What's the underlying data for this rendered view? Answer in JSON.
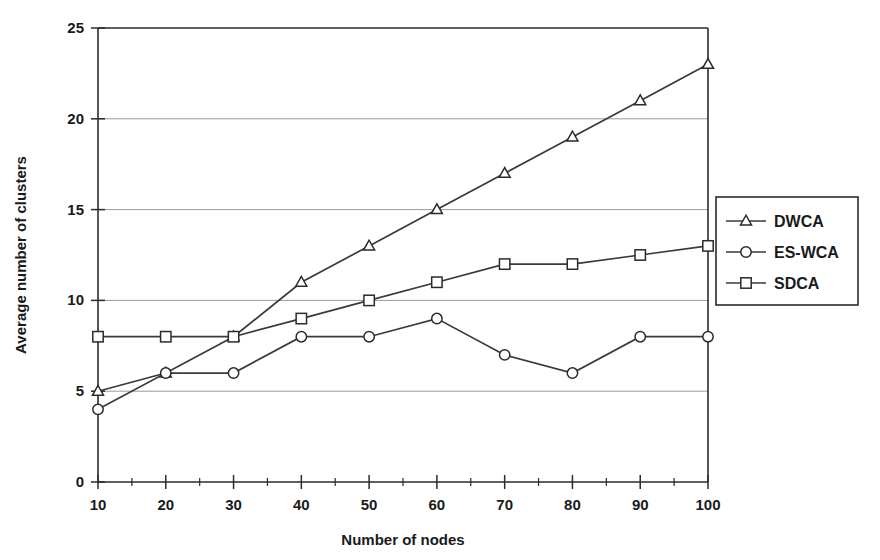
{
  "chart_data": {
    "type": "line",
    "title": "",
    "xlabel": "Number of nodes",
    "ylabel": "Average number of clusters",
    "x": [
      10,
      20,
      30,
      40,
      50,
      60,
      70,
      80,
      90,
      100
    ],
    "xticklabels": [
      "10",
      "20",
      "30",
      "40",
      "50",
      "60",
      "70",
      "80",
      "90",
      "100"
    ],
    "yticklabels": [
      "0",
      "5",
      "10",
      "15",
      "20",
      "25"
    ],
    "yticks": [
      0,
      5,
      10,
      15,
      20,
      25
    ],
    "xlim": [
      10,
      100
    ],
    "ylim": [
      0,
      25
    ],
    "grid": "horizontal",
    "legend_position": "right-outside",
    "series": [
      {
        "name": "DWCA",
        "marker": "triangle",
        "values": [
          5,
          6,
          8,
          11,
          13,
          15,
          17,
          19,
          21,
          23
        ]
      },
      {
        "name": "ES-WCA",
        "marker": "circle",
        "values": [
          4,
          6,
          6,
          8,
          8,
          9,
          7,
          6,
          8,
          8
        ]
      },
      {
        "name": "SDCA",
        "marker": "square",
        "values": [
          8,
          8,
          8,
          9,
          10,
          11,
          12,
          12,
          12.5,
          13
        ]
      }
    ]
  },
  "legend": {
    "items": [
      {
        "label": "DWCA",
        "marker": "triangle"
      },
      {
        "label": "ES-WCA",
        "marker": "circle"
      },
      {
        "label": "SDCA",
        "marker": "square"
      }
    ]
  },
  "colors": {
    "axis": "#2b2b2b",
    "grid": "#9a9a9a",
    "line": "#3a3a3a",
    "marker_fill": "#ffffff",
    "background": "#ffffff"
  }
}
